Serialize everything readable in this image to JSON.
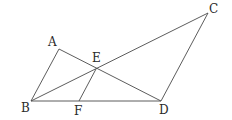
{
  "diagram": {
    "type": "geometry-figure",
    "points": {
      "A": {
        "x": 59,
        "y": 49,
        "label": "A",
        "lx": 48,
        "ly": 46
      },
      "B": {
        "x": 31,
        "y": 101,
        "label": "B",
        "lx": 21,
        "ly": 112
      },
      "C": {
        "x": 208,
        "y": 13,
        "label": "C",
        "lx": 209,
        "ly": 13
      },
      "D": {
        "x": 161,
        "y": 101,
        "label": "D",
        "lx": 159,
        "ly": 114
      },
      "E": {
        "x": 96,
        "y": 69,
        "label": "E",
        "lx": 92,
        "ly": 62
      },
      "F": {
        "x": 79,
        "y": 101,
        "label": "F",
        "lx": 74,
        "ly": 115
      }
    },
    "segments": [
      {
        "from": "A",
        "to": "B"
      },
      {
        "from": "A",
        "to": "D"
      },
      {
        "from": "B",
        "to": "C"
      },
      {
        "from": "C",
        "to": "D"
      },
      {
        "from": "B",
        "to": "D"
      },
      {
        "from": "E",
        "to": "F"
      }
    ],
    "labels": [
      "A",
      "B",
      "C",
      "D",
      "E",
      "F"
    ],
    "colors": {
      "line": "#4a4a4a",
      "text": "#2a2a2a",
      "background": "#ffffff"
    }
  }
}
